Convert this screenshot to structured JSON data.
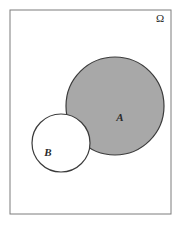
{
  "figure": {
    "kind": "venn-diagram",
    "background_color": "#ffffff",
    "width": 181,
    "height": 226
  },
  "universe": {
    "label": "Ω",
    "label_name": "omega-symbol",
    "box": {
      "x": 10,
      "y": 10,
      "width": 161,
      "height": 204,
      "stroke_color": "#7d7d7d",
      "stroke_width": 1,
      "fill": "#ffffff"
    },
    "label_position": {
      "x": 160,
      "y": 22
    }
  },
  "sets": [
    {
      "id": "A",
      "label": "A",
      "label_name": "set-label-a",
      "shaded": true,
      "fill_color": "#a8a8a8",
      "stroke_color": "#3b3b3b",
      "stroke_width": 1.2,
      "center": {
        "x": 115,
        "y": 106
      },
      "radius": 49,
      "label_position": {
        "x": 120,
        "y": 121
      }
    },
    {
      "id": "B",
      "label": "B",
      "label_name": "set-label-b",
      "shaded": false,
      "fill_color": "#ffffff",
      "stroke_color": "#3b3b3b",
      "stroke_width": 1.2,
      "center": {
        "x": 61,
        "y": 143
      },
      "radius": 29,
      "label_position": {
        "x": 48,
        "y": 156
      }
    }
  ],
  "shading": {
    "description": "A minus B",
    "shaded_region_color": "#a8a8a8",
    "unshaded_region_color": "#ffffff"
  }
}
